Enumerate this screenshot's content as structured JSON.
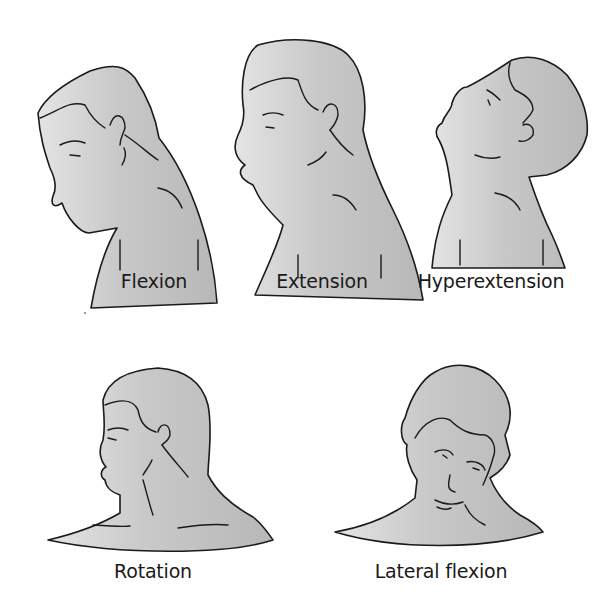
{
  "figure": {
    "panels": [
      {
        "id": "flexion",
        "label": "Flexion",
        "view": "side profile, head bent forward"
      },
      {
        "id": "extension",
        "label": "Extension",
        "view": "side profile, head upright"
      },
      {
        "id": "hyperextension",
        "label": "Hyperextension",
        "view": "side profile, head tilted back"
      },
      {
        "id": "rotation",
        "label": "Rotation",
        "view": "head turned to the side"
      },
      {
        "id": "lateral-flexion",
        "label": "Lateral flexion",
        "view": "front view, head tilted to shoulder"
      }
    ],
    "colors": {
      "skin_light": "#e6e6e6",
      "skin_dark": "#b9b9b9",
      "outline": "#1a1a1a",
      "background": "#ffffff"
    }
  }
}
